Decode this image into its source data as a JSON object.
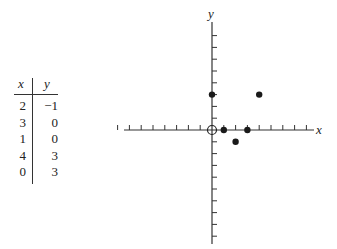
{
  "table": {
    "headers": [
      "x",
      "y"
    ],
    "rows": [
      {
        "x": "2",
        "y": "−1"
      },
      {
        "x": "3",
        "y": "0"
      },
      {
        "x": "1",
        "y": "0"
      },
      {
        "x": "4",
        "y": "3"
      },
      {
        "x": "0",
        "y": "3"
      }
    ]
  },
  "chart_data": {
    "type": "scatter",
    "title": "",
    "xlabel": "x",
    "ylabel": "y",
    "xlim": [
      -8,
      9
    ],
    "ylim": [
      -9,
      9
    ],
    "grid": false,
    "points": [
      {
        "x": 2,
        "y": -1,
        "style": "filled"
      },
      {
        "x": 3,
        "y": 0,
        "style": "filled"
      },
      {
        "x": 1,
        "y": 0,
        "style": "filled"
      },
      {
        "x": 4,
        "y": 3,
        "style": "filled"
      },
      {
        "x": 0,
        "y": 3,
        "style": "filled"
      },
      {
        "x": 0,
        "y": 0,
        "style": "open"
      }
    ],
    "x_ticks": [
      -8,
      -7,
      -6,
      -5,
      -4,
      -3,
      -2,
      -1,
      1,
      2,
      3,
      4,
      5,
      6,
      7,
      8
    ],
    "y_ticks": [
      -9,
      -8,
      -7,
      -6,
      -5,
      -4,
      -3,
      -2,
      -1,
      1,
      2,
      3,
      4,
      5,
      6,
      7,
      8,
      9
    ]
  }
}
